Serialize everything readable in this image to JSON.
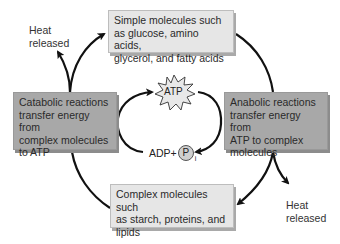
{
  "diagram": {
    "top_box": {
      "line1": "Simple molecules such",
      "line2": "as glucose, amino acids,",
      "line3": "glycerol, and fatty acids"
    },
    "left_box": {
      "line1": "Catabolic reactions",
      "line2": "transfer energy from",
      "line3": "complex molecules",
      "line4": "to ATP"
    },
    "right_box": {
      "line1": "Anabolic reactions",
      "line2": "transfer energy from",
      "line3": "ATP to complex",
      "line4": "molecules"
    },
    "bottom_box": {
      "line1": "Complex molecules such",
      "line2": "as starch, proteins, and",
      "line3": "lipids"
    },
    "heat_top_left": {
      "line1": "Heat",
      "line2": "released"
    },
    "heat_bottom_right": {
      "line1": "Heat",
      "line2": "released"
    },
    "atp_label": "ATP",
    "adp_label": "ADP+",
    "phosphate_label": "P",
    "phosphate_subscript": "i",
    "colors": {
      "light_box": "#e6e6e6",
      "dark_box": "#a8a8a8",
      "arrow": "#111111"
    }
  }
}
